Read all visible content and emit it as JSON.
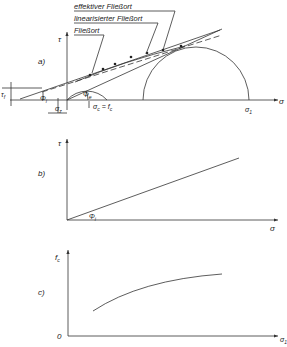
{
  "panel_a": {
    "label": "a)",
    "y_axis": "τ",
    "x_axis": "σ",
    "legend": [
      "effektiver Fließort",
      "linearisierter Fließort",
      "Fließort"
    ],
    "annotations": {
      "tau_f": "τ",
      "tau_f_sub": "f",
      "phi_i": "Φ",
      "phi_i_sub": "i",
      "phi_e": "Φ",
      "phi_e_sub": "e",
      "sigma_z": "σ",
      "sigma_z_sub": "z",
      "sigma_c": "σ",
      "sigma_c_eq": "c = f",
      "sigma_c_sub": "c",
      "sigma_1": "σ",
      "sigma_1_sub": "1"
    }
  },
  "panel_b": {
    "label": "b)",
    "y_axis": "τ",
    "x_axis": "σ",
    "angle": "Φ",
    "angle_sub": "i"
  },
  "panel_c": {
    "label": "c)",
    "y_axis": "f",
    "y_axis_sub": "c",
    "x_axis": "σ",
    "x_axis_sub": "1",
    "origin": "0"
  }
}
